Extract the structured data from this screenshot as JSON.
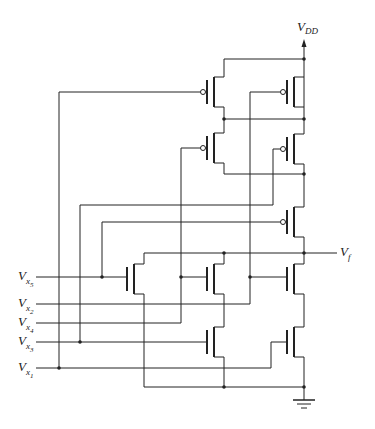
{
  "diagram": {
    "type": "CMOS logic gate schematic",
    "supply_label": "V",
    "supply_sub": "DD",
    "output_label": "V",
    "output_sub": "f",
    "inputs": [
      {
        "name": "x5",
        "label": "V",
        "sub": "x",
        "idx": "5"
      },
      {
        "name": "x2",
        "label": "V",
        "sub": "x",
        "idx": "2"
      },
      {
        "name": "x4",
        "label": "V",
        "sub": "x",
        "idx": "4"
      },
      {
        "name": "x3",
        "label": "V",
        "sub": "x",
        "idx": "3"
      },
      {
        "name": "x1",
        "label": "V",
        "sub": "x",
        "idx": "1"
      }
    ],
    "pmos_count": 5,
    "nmos_count": 5,
    "colors": {
      "wire": "#222222",
      "background": "#ffffff"
    }
  }
}
